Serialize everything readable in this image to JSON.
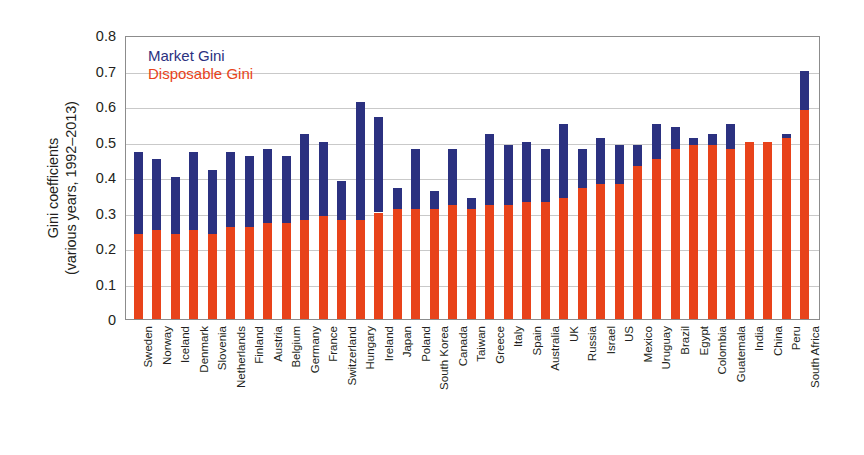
{
  "chart_data": {
    "type": "bar",
    "title": "",
    "subtitle": "",
    "xlabel": "",
    "ylabel": "Gini coefficients (various years, 1992–2013)",
    "ylabel_line1": "Gini coefficients",
    "ylabel_line2": "(various years, 1992–2013)",
    "ylim": [
      0,
      0.8
    ],
    "ytick_labels": [
      "0",
      "0.1",
      "0.2",
      "0.3",
      "0.4",
      "0.5",
      "0.6",
      "0.7",
      "0.8"
    ],
    "ytick_values": [
      0,
      0.1,
      0.2,
      0.3,
      0.4,
      0.5,
      0.6,
      0.7,
      0.8
    ],
    "grid": true,
    "grid_axis": "y",
    "legend_position": "top-left-inside",
    "stacked_overlay": true,
    "colors": {
      "market": "#2b3180",
      "disposable": "#e8431a",
      "grid": "#c9c9c9",
      "frame": "#8c8c8c",
      "text": "#231f20",
      "background": "#ffffff"
    },
    "legend": [
      {
        "name": "Market Gini",
        "color": "#2b3180"
      },
      {
        "name": "Disposable Gini",
        "color": "#e8431a"
      }
    ],
    "categories": [
      "Sweden",
      "Norway",
      "Iceland",
      "Denmark",
      "Slovenia",
      "Netherlands",
      "Finland",
      "Austria",
      "Belgium",
      "Germany",
      "France",
      "Switzerland",
      "Hungary",
      "Ireland",
      "Japan",
      "Poland",
      "South Korea",
      "Canada",
      "Taiwan",
      "Greece",
      "Italy",
      "Spain",
      "Australia",
      "UK",
      "Russia",
      "Israel",
      "US",
      "Mexico",
      "Uruguay",
      "Brazil",
      "Egypt",
      "Colombia",
      "Guatemala",
      "India",
      "China",
      "Peru",
      "South Africa"
    ],
    "series": [
      {
        "name": "Market Gini",
        "color": "#2b3180",
        "values": [
          0.47,
          0.45,
          0.4,
          0.47,
          0.42,
          0.47,
          0.46,
          0.48,
          0.46,
          0.52,
          0.5,
          0.39,
          0.61,
          0.57,
          0.37,
          0.48,
          0.36,
          0.48,
          0.34,
          0.52,
          0.49,
          0.5,
          0.48,
          0.55,
          0.48,
          0.51,
          0.49,
          0.49,
          0.55,
          0.54,
          0.51,
          0.52,
          0.55,
          0.5,
          0.5,
          0.52,
          0.7
        ]
      },
      {
        "name": "Disposable Gini",
        "color": "#e8431a",
        "values": [
          0.24,
          0.25,
          0.24,
          0.25,
          0.24,
          0.26,
          0.26,
          0.27,
          0.27,
          0.28,
          0.29,
          0.28,
          0.28,
          0.3,
          0.31,
          0.31,
          0.31,
          0.32,
          0.31,
          0.32,
          0.32,
          0.33,
          0.33,
          0.34,
          0.37,
          0.38,
          0.38,
          0.43,
          0.45,
          0.48,
          0.49,
          0.49,
          0.48,
          0.5,
          0.5,
          0.51,
          0.59
        ]
      }
    ]
  }
}
